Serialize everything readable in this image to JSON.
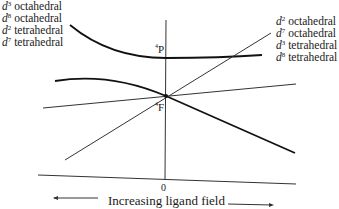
{
  "left_labels": [
    {
      "d": "d",
      "n": "3",
      "geom": "octahedral"
    },
    {
      "d": "d",
      "n": "8",
      "geom": "octahedral"
    },
    {
      "d": "d",
      "n": "2",
      "geom": "tetrahedral"
    },
    {
      "d": "d",
      "n": "7",
      "geom": "tetrahedral"
    }
  ],
  "right_labels": [
    {
      "d": "d",
      "n": "2",
      "geom": "octahedral"
    },
    {
      "d": "d",
      "n": "7",
      "geom": "octahedral"
    },
    {
      "d": "d",
      "n": "3",
      "geom": "tetrahedral"
    },
    {
      "d": "d",
      "n": "8",
      "geom": "tetrahedral"
    }
  ],
  "terms": {
    "P": {
      "mult": "4",
      "symbol": "P"
    },
    "F": {
      "mult": "4",
      "symbol": "F"
    }
  },
  "axis": {
    "zero": "0",
    "label": "Increasing ligand field"
  }
}
